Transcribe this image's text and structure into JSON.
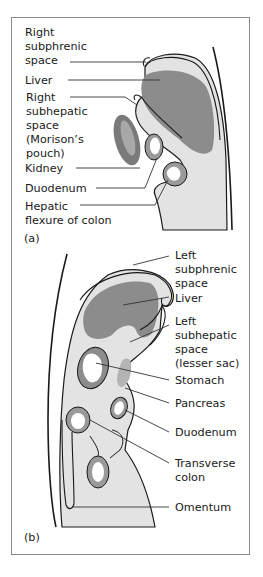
{
  "figure": {
    "panel_a": {
      "tag": "(a)",
      "labels": [
        {
          "lines": [
            "Right",
            "subphrenic",
            "space"
          ]
        },
        {
          "lines": [
            "Liver"
          ]
        },
        {
          "lines": [
            "Right",
            "subhepatic",
            "space",
            "(Morison’s",
            "pouch)"
          ]
        },
        {
          "lines": [
            "Kidney"
          ]
        },
        {
          "lines": [
            "Duodenum"
          ]
        },
        {
          "lines": [
            "Hepatic",
            "flexure of colon"
          ]
        }
      ]
    },
    "panel_b": {
      "tag": "(b)",
      "labels": [
        {
          "lines": [
            "Left",
            "subphrenic",
            "space"
          ]
        },
        {
          "lines": [
            "Liver"
          ]
        },
        {
          "lines": [
            "Left",
            "subhepatic",
            "space",
            "(lesser sac)"
          ]
        },
        {
          "lines": [
            "Stomach"
          ]
        },
        {
          "lines": [
            "Pancreas"
          ]
        },
        {
          "lines": [
            "Duodenum"
          ]
        },
        {
          "lines": [
            "Transverse",
            "colon"
          ]
        },
        {
          "lines": [
            "Omentum"
          ]
        }
      ]
    },
    "colors": {
      "peritoneal_fill": "#e3e3e3",
      "liver": "#8c8c8c",
      "kidney_outer": "#7a7a7a",
      "kidney_inner": "#a8a8a8",
      "pancreas": "#b4b4b4",
      "bowel_wall": "#9a9a9a",
      "outline": "#1a1a1a",
      "frame": "#8a8a8a"
    }
  }
}
